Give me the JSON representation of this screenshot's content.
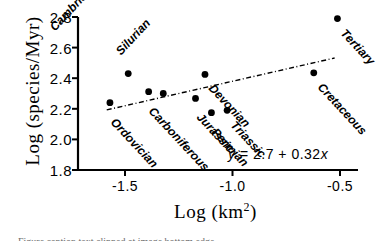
{
  "chart_data": {
    "type": "scatter",
    "title": "",
    "xlabel": "Log (km2)",
    "xlabel_base": "Log (km",
    "xlabel_exponent": "2",
    "xlabel_close": ")",
    "ylabel": "Log (species/Myr)",
    "xlim": [
      -1.72,
      -0.42
    ],
    "ylim": [
      1.78,
      2.86
    ],
    "xticks": [
      -1.5,
      -1.0,
      -0.5
    ],
    "xtick_labels": [
      "-1.5",
      "-1.0",
      "-0.5"
    ],
    "yticks": [
      1.8,
      2.0,
      2.2,
      2.4,
      2.6,
      2.8
    ],
    "ytick_labels": [
      "2.8",
      "2.6",
      "2.4",
      "2.2",
      "2.0",
      "1.8"
    ],
    "grid": false,
    "legend": "none",
    "marker_color": "#000000",
    "line_color": "#000000",
    "axis_color": "#000000",
    "points": [
      {
        "label": "Cambrian",
        "x": -1.485,
        "y": 2.43,
        "label_angle": -47,
        "label_dx": -76,
        "label_dy": -52
      },
      {
        "label": "Ordovician",
        "x": -1.57,
        "y": 2.24,
        "label_angle": 47,
        "label_dx": 3,
        "label_dy": 10
      },
      {
        "label": "Carboniferous",
        "x": -1.39,
        "y": 2.312,
        "label_angle": 47,
        "label_dx": 2,
        "label_dy": 10
      },
      {
        "label": "Silurian",
        "x": -1.322,
        "y": 2.3,
        "label_angle": -47,
        "label_dx": -45,
        "label_dy": -48
      },
      {
        "label": "Devonian",
        "x": -1.128,
        "y": 2.425,
        "label_angle": 47,
        "label_dx": 6,
        "label_dy": 5
      },
      {
        "label": "Jurassic",
        "x": -1.172,
        "y": 2.268,
        "label_angle": 47,
        "label_dx": 3,
        "label_dy": 10
      },
      {
        "label": "Permian",
        "x": -1.098,
        "y": 2.175,
        "label_angle": 47,
        "label_dx": 3,
        "label_dy": 10
      },
      {
        "label": "Triassic",
        "x": -1.025,
        "y": 2.19,
        "label_angle": 47,
        "label_dx": 6,
        "label_dy": 6
      },
      {
        "label": "Cretaceous",
        "x": -0.622,
        "y": 2.435,
        "label_angle": 47,
        "label_dx": 6,
        "label_dy": 5
      },
      {
        "label": "Tertiary",
        "x": -0.512,
        "y": 2.79,
        "label_angle": 47,
        "label_dx": 6,
        "label_dy": 5
      }
    ],
    "fit_line": {
      "intercept": 2.7,
      "slope": 0.32,
      "x_start": -1.585,
      "x_end": -0.525,
      "style": "dash-dot",
      "equation_text": "y = 2.7 + 0.32x",
      "equation_parts": {
        "y": "y",
        "eq": " = ",
        "intercept": "2.7",
        "plus": " + ",
        "slope": "0.32",
        "x": "x"
      }
    }
  },
  "caption": {
    "sliver_text": "Figure caption text clipped at image bottom edge"
  }
}
